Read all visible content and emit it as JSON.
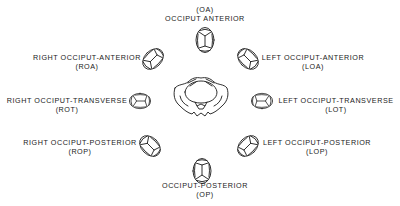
{
  "diagram": {
    "type": "fetal-head-positions",
    "center": {
      "name": "maternal-pelvis"
    },
    "positions": [
      {
        "id": "OA",
        "name": "OCCIPUT ANTERIOR",
        "abbr": "(OA)"
      },
      {
        "id": "ROA",
        "name": "RIGHT OCCIPUT-ANTERIOR",
        "abbr": "(ROA)"
      },
      {
        "id": "LOA",
        "name": "LEFT OCCIPUT-ANTERIOR",
        "abbr": "(LOA)"
      },
      {
        "id": "ROT",
        "name": "RIGHT OCCIPUT-TRANSVERSE",
        "abbr": "(ROT)"
      },
      {
        "id": "LOT",
        "name": "LEFT OCCIPUT-TRANSVERSE",
        "abbr": "(LOT)"
      },
      {
        "id": "ROP",
        "name": "RIGHT OCCIPUT-POSTERIOR",
        "abbr": "(ROP)"
      },
      {
        "id": "LOP",
        "name": "LEFT OCCIPUT-POSTERIOR",
        "abbr": "(LOP)"
      },
      {
        "id": "OP",
        "name": "OCCIPUT-POSTERIOR",
        "abbr": "(OP)"
      }
    ]
  },
  "colors": {
    "line": "#1a1a1a",
    "background": "#ffffff"
  }
}
